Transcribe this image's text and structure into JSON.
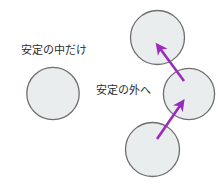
{
  "canvas": {
    "width": 224,
    "height": 184,
    "background_color": "#ffffff"
  },
  "style": {
    "circle_fill": "#e9edee",
    "circle_stroke": "#6e6e6e",
    "arrow_color": "#9b2bbd",
    "text_color": "#2b2b2b"
  },
  "labels": {
    "inside_stability": "安定の中だけ",
    "outside_stability": "安定の外へ"
  },
  "shapes": {
    "circles": [
      {
        "name": "static-circle",
        "cx": 53,
        "cy": 93.5,
        "r": 26.5
      },
      {
        "name": "moving-circle-bottom",
        "cx": 152.5,
        "cy": 149.5,
        "r": 27.5
      },
      {
        "name": "moving-circle-middle",
        "cx": 189,
        "cy": 94,
        "r": 26
      },
      {
        "name": "moving-circle-top",
        "cx": 157.5,
        "cy": 37.5,
        "r": 27.5
      }
    ],
    "arrows": [
      {
        "name": "arrow-bottom-to-middle",
        "from": {
          "x": 157,
          "y": 139
        },
        "to": {
          "x": 180,
          "y": 104
        }
      },
      {
        "name": "arrow-middle-to-top",
        "from": {
          "x": 184,
          "y": 81
        },
        "to": {
          "x": 159,
          "y": 47
        }
      }
    ]
  }
}
